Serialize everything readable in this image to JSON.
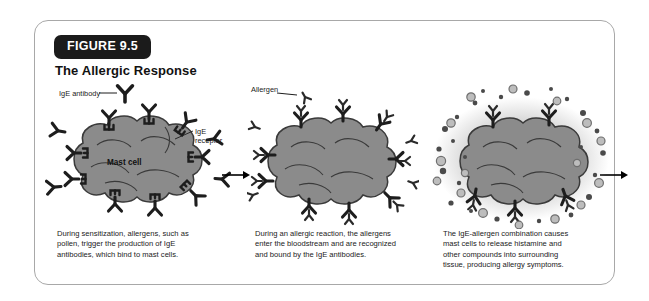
{
  "figure": {
    "badge": "FIGURE 9.5",
    "title": "The Allergic Response"
  },
  "labels": {
    "ige_antibody": "IgE antibody",
    "mast_cell": "Mast cell",
    "ige_receptor": "IgE\nreceptor",
    "allergen": "Allergen"
  },
  "panels": [
    {
      "name": "sensitization",
      "caption": "During sensitization, allergens, such as\npollen, trigger the production of IgE\nantibodies, which bind to mast cells."
    },
    {
      "name": "allergic-reaction",
      "caption": "During an allergic reaction, the allergens\nenter the bloodstream and are recognized\nand bound by the IgE antibodies."
    },
    {
      "name": "degranulation",
      "caption": "The IgE-allergen combination causes\nmast cells to release histamine and\nother compounds into surrounding\ntissue, producing allergy symptoms."
    }
  ],
  "colors": {
    "badge_background": "#1b1b1b",
    "badge_text": "#ffffff",
    "border": "#a8a8a8",
    "cell_fill": "#8b8b8b",
    "cell_outline": "#3a3a3a",
    "granule_dark": "#4a4a4a",
    "granule_light": "#b5b5b5",
    "arrow": "#000000",
    "background": "#ffffff"
  },
  "icons": {
    "antibody": "ige-antibody-icon",
    "receptor": "ige-receptor-icon",
    "allergen": "allergen-icon",
    "granule": "granule-icon",
    "arrow": "arrow-right-icon"
  }
}
